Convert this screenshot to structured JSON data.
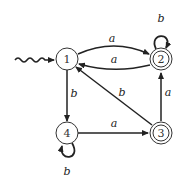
{
  "diagram": {
    "type": "finite-automaton",
    "start_state": "1",
    "states": [
      {
        "id": "1",
        "label": "1",
        "accepting": false,
        "x": 67,
        "y": 59
      },
      {
        "id": "2",
        "label": "2",
        "accepting": true,
        "x": 161,
        "y": 59
      },
      {
        "id": "3",
        "label": "3",
        "accepting": true,
        "x": 161,
        "y": 133
      },
      {
        "id": "4",
        "label": "4",
        "accepting": false,
        "x": 67,
        "y": 133
      }
    ],
    "transitions": [
      {
        "from": "1",
        "to": "2",
        "label": "a"
      },
      {
        "from": "2",
        "to": "1",
        "label": "a"
      },
      {
        "from": "2",
        "to": "2",
        "label": "b"
      },
      {
        "from": "1",
        "to": "4",
        "label": "b"
      },
      {
        "from": "4",
        "to": "4",
        "label": "b"
      },
      {
        "from": "4",
        "to": "3",
        "label": "a"
      },
      {
        "from": "3",
        "to": "2",
        "label": "a"
      },
      {
        "from": "3",
        "to": "1",
        "label": "b"
      }
    ]
  }
}
